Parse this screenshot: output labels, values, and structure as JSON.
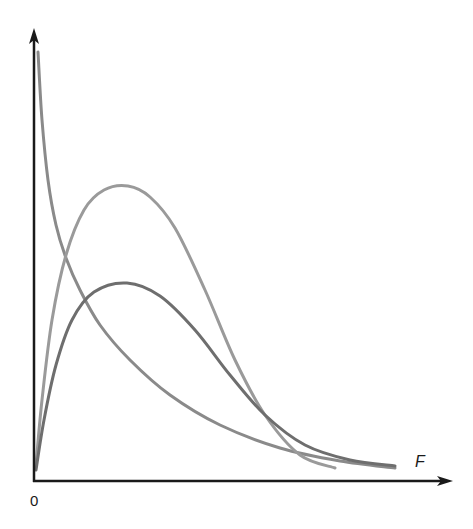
{
  "chart_data": {
    "type": "line",
    "title": "",
    "xlabel": "F",
    "ylabel": "",
    "origin_label": "0",
    "grid": false,
    "legend": null,
    "series": [
      {
        "name": "curve-decay",
        "color": "#8a8a8a",
        "shape": "monotone decreasing from near y-axis top, asymptotic to x-axis",
        "points_px": [
          [
            38,
            52
          ],
          [
            42,
            120
          ],
          [
            48,
            180
          ],
          [
            56,
            225
          ],
          [
            66,
            258
          ],
          [
            80,
            290
          ],
          [
            100,
            325
          ],
          [
            130,
            360
          ],
          [
            170,
            395
          ],
          [
            220,
            425
          ],
          [
            280,
            448
          ],
          [
            340,
            461
          ],
          [
            395,
            468
          ]
        ]
      },
      {
        "name": "curve-tall-peak",
        "color": "#9a9a9a",
        "shape": "right-skewed, taller and narrower peak",
        "peak_px": [
          128,
          186
        ],
        "points_px": [
          [
            36,
            465
          ],
          [
            42,
            400
          ],
          [
            52,
            320
          ],
          [
            66,
            255
          ],
          [
            84,
            210
          ],
          [
            104,
            190
          ],
          [
            128,
            186
          ],
          [
            150,
            197
          ],
          [
            175,
            228
          ],
          [
            205,
            290
          ],
          [
            235,
            360
          ],
          [
            265,
            415
          ],
          [
            300,
            455
          ],
          [
            335,
            468
          ]
        ]
      },
      {
        "name": "curve-low-peak",
        "color": "#6e6e6e",
        "shape": "right-skewed, lower broader peak",
        "peak_px": [
          127,
          283
        ],
        "points_px": [
          [
            36,
            470
          ],
          [
            44,
            420
          ],
          [
            56,
            365
          ],
          [
            72,
            320
          ],
          [
            94,
            292
          ],
          [
            127,
            283
          ],
          [
            160,
            296
          ],
          [
            195,
            330
          ],
          [
            230,
            375
          ],
          [
            265,
            415
          ],
          [
            305,
            445
          ],
          [
            350,
            460
          ],
          [
            395,
            466
          ]
        ]
      }
    ],
    "axes": {
      "origin_px": [
        34,
        481
      ],
      "y_axis_top_px": 28,
      "x_axis_right_px": 453,
      "color": "#1a1a1a"
    }
  },
  "labels": {
    "origin": "0",
    "x_axis": "F"
  }
}
